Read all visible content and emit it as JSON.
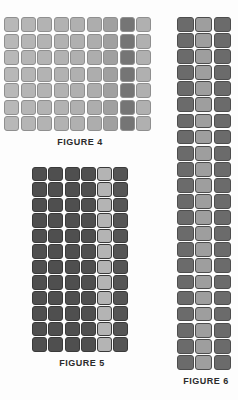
{
  "page": {
    "background_color": "#fdfdfd",
    "kind": "patent-figure-sheet"
  },
  "figures": [
    {
      "id": "figure-4",
      "label": "FIGURE 4",
      "columns": 9,
      "rows": 7,
      "cell_shape": "rounded-square",
      "column_colors": [
        "#b8b8b8",
        "#b5b5b5",
        "#b3b3b3",
        "#b2b2b2",
        "#b0b0b0",
        "#adadad",
        "#a0a0a0",
        "#757575",
        "#b0b0b0"
      ],
      "border_color": "#8f8f8f",
      "highlight_column_index": 7,
      "highlight_color": "#757575"
    },
    {
      "id": "figure-5",
      "label": "FIGURE 5",
      "columns": 6,
      "rows": 12,
      "cell_shape": "rounded-square",
      "column_colors": [
        "#4f4f4f",
        "#4f4f4f",
        "#4f4f4f",
        "#4f4f4f",
        "#b4b4b4",
        "#555555"
      ],
      "border_color": "#3a3a3a",
      "highlight_column_index": 4,
      "highlight_color": "#b4b4b4"
    },
    {
      "id": "figure-6",
      "label": "FIGURE 6",
      "columns": 3,
      "rows": 22,
      "cell_shape": "rounded-square",
      "column_colors": [
        "#6b6b6b",
        "#9e9e9e",
        "#6b6b6b"
      ],
      "border_color": "#4d4d4d",
      "highlight_column_index": 1,
      "highlight_color": "#9e9e9e"
    }
  ]
}
